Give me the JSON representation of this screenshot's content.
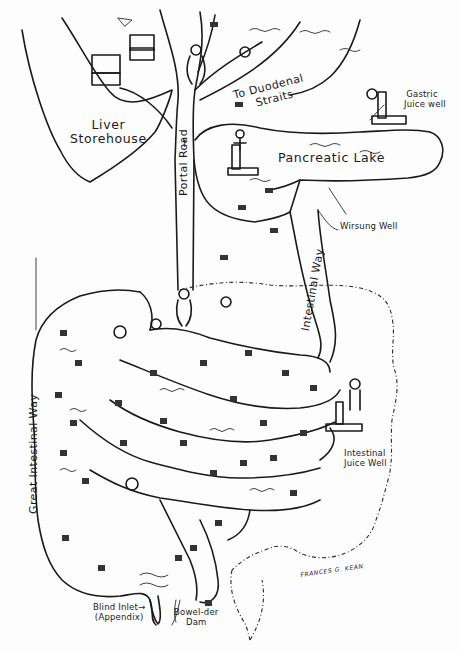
{
  "illustration": {
    "title": "Digestive system drawn as a map",
    "signature": "FRANCES G. KEAN",
    "background_color": "#fdfdfd",
    "ink_color": "#1a1a1a"
  },
  "labels": {
    "liver": {
      "line1": "Liver",
      "line2": "Storehouse"
    },
    "portal_road": "Portal Road",
    "duodenal": {
      "line1": "To Duodenal",
      "line2": "Straits"
    },
    "gastric_well": {
      "line1": "Gastric",
      "line2": "Juice well"
    },
    "pancreatic_lake": "Pancreatic Lake",
    "wirsung_well": "Wirsung Well",
    "intestinal_way": "Intestinal Way",
    "great_intestinal_way": "Great Intestinal Way",
    "intestinal_juice_well": {
      "line1": "Intestinal",
      "line2": "Juice Well"
    },
    "blind_inlet": {
      "line1": "Blind Inlet",
      "line2": "(Appendix)",
      "arrow": "→"
    },
    "bowel_der_dam": {
      "line1": "Bowel-der",
      "line2": "Dam"
    },
    "up_arrow": "↑"
  },
  "icons": {
    "worker_figure": "person-sketch",
    "food_basket": "basket-sketch",
    "crate": "crate-sketch",
    "pump": "water-pump-sketch"
  }
}
